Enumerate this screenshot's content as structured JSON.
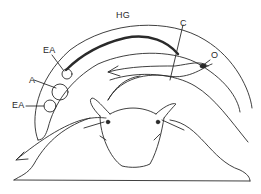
{
  "diagram": {
    "labels": [
      {
        "id": "HG",
        "text": "HG",
        "x": 116,
        "y": 11
      },
      {
        "id": "C",
        "text": "C",
        "x": 180,
        "y": 19
      },
      {
        "id": "O",
        "text": "O",
        "x": 213,
        "y": 53
      },
      {
        "id": "EA_top",
        "text": "EA",
        "x": 43,
        "y": 47
      },
      {
        "id": "A",
        "text": "A",
        "x": 29,
        "y": 76
      },
      {
        "id": "EA_bottom",
        "text": "EA",
        "x": 12,
        "y": 102
      }
    ],
    "colors": {
      "stroke": "#2a2a2a",
      "background": "#ffffff"
    }
  }
}
